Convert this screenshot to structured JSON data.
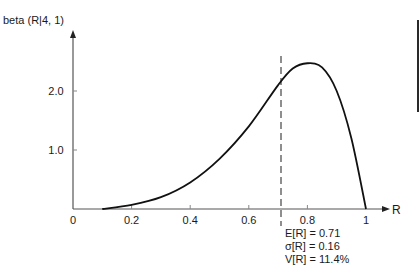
{
  "chart_data": {
    "type": "line",
    "title": "",
    "ylabel": "beta (R|4, 1)",
    "xlabel": "R",
    "xlim": [
      0,
      1
    ],
    "ylim": [
      0,
      2.6
    ],
    "grid": false,
    "x_ticks": [
      "0",
      "0.2",
      "0.4",
      "0.6",
      "0.8",
      "1"
    ],
    "y_ticks": [
      "1.0",
      "2.0"
    ],
    "series": [
      {
        "name": "beta density",
        "x": [
          0.1,
          0.2,
          0.3,
          0.4,
          0.5,
          0.6,
          0.7,
          0.75,
          0.8,
          0.85,
          0.9,
          0.95,
          1.0
        ],
        "values": [
          0.0,
          0.07,
          0.2,
          0.45,
          0.85,
          1.4,
          2.1,
          2.38,
          2.47,
          2.4,
          2.0,
          1.2,
          0.0
        ]
      }
    ],
    "annotations": {
      "mean_line": {
        "x": 0.71,
        "style": "dashed"
      },
      "stats": [
        "E[R] = 0.71",
        "σ[R] = 0.16",
        "V[R] = 11.4%"
      ]
    }
  },
  "labels": {
    "y_axis": "beta (R|4, 1)",
    "x_axis": "R",
    "x_ticks": [
      "0",
      "0.2",
      "0.4",
      "0.6",
      "0.8",
      "1"
    ],
    "y_ticks": [
      "1.0",
      "2.0"
    ],
    "stats": {
      "mean": "E[R] = 0.71",
      "sigma": "σ[R] = 0.16",
      "variance": "V[R] = 11.4%"
    }
  }
}
